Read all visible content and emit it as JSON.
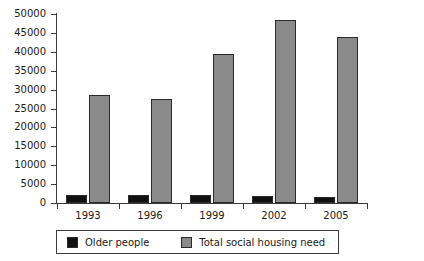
{
  "chart_data": {
    "type": "bar",
    "title": "",
    "xlabel": "",
    "ylabel": "",
    "categories": [
      "1993",
      "1996",
      "1999",
      "2002",
      "2005"
    ],
    "series": [
      {
        "name": "Older people",
        "color": "#111111",
        "values": [
          2100,
          2000,
          2250,
          1900,
          1650
        ]
      },
      {
        "name": "Total social housing need",
        "color": "#8a8a8a",
        "values": [
          28700,
          27400,
          39300,
          48500,
          43900
        ]
      }
    ],
    "ylim": [
      0,
      50000
    ],
    "ytick_values": [
      0,
      5000,
      10000,
      15000,
      20000,
      25000,
      30000,
      35000,
      40000,
      45000,
      50000
    ],
    "ytick_labels": [
      "0",
      "5000",
      "10000",
      "15000",
      "20000",
      "25000",
      "30000",
      "35000",
      "40000",
      "45000",
      "50000"
    ],
    "grid": false,
    "legend_position": "bottom"
  },
  "figure": {
    "clipped_title": "",
    "background_color": "#ffffff",
    "axis_color": "#3a3a3a"
  },
  "legend": {
    "entries": [
      {
        "label": "Older people",
        "color": "#111111"
      },
      {
        "label": "Total social housing need",
        "color": "#8a8a8a"
      }
    ]
  }
}
